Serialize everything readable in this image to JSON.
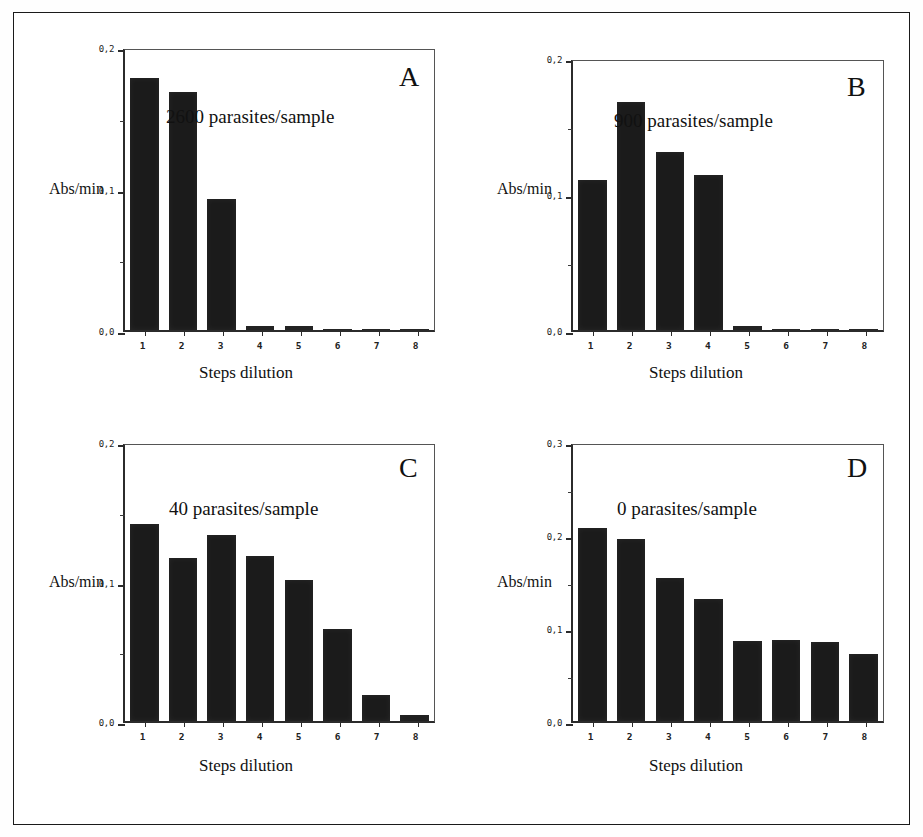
{
  "figure": {
    "axis_title_y": "Abs/min",
    "axis_title_x": "Steps dilution",
    "categories": [
      "1",
      "2",
      "3",
      "4",
      "5",
      "6",
      "7",
      "8"
    ]
  },
  "chart_data": [
    {
      "type": "bar",
      "panel": "A",
      "title": "2600 parasites/sample",
      "categories": [
        "1",
        "2",
        "3",
        "4",
        "5",
        "6",
        "7",
        "8"
      ],
      "values": [
        0.178,
        0.168,
        0.0925,
        0.003,
        0.003,
        0.001,
        0.001,
        0.001
      ],
      "xlabel": "Steps dilution",
      "ylabel": "Abs/min",
      "ylim": [
        0,
        0.2
      ],
      "yticks": [
        "0,0",
        "0,1",
        "0,2"
      ],
      "ytick_values": [
        0.0,
        0.1,
        0.2
      ],
      "yminor_values": [
        0.05,
        0.15
      ],
      "grid": false,
      "legend": "none"
    },
    {
      "type": "bar",
      "panel": "B",
      "title": "900 parasites/sample",
      "categories": [
        "1",
        "2",
        "3",
        "4",
        "5",
        "6",
        "7",
        "8"
      ],
      "values": [
        0.11,
        0.168,
        0.131,
        0.114,
        0.003,
        0.001,
        0.001,
        0.001
      ],
      "xlabel": "Steps dilution",
      "ylabel": "Abs/min",
      "ylim": [
        0,
        0.2
      ],
      "yticks": [
        "0,0",
        "0,1",
        "0,2"
      ],
      "ytick_values": [
        0.0,
        0.1,
        0.2
      ],
      "yminor_values": [
        0.05,
        0.15
      ],
      "grid": false,
      "legend": "none"
    },
    {
      "type": "bar",
      "panel": "C",
      "title": "40 parasites/sample",
      "categories": [
        "1",
        "2",
        "3",
        "4",
        "5",
        "6",
        "7",
        "8"
      ],
      "values": [
        0.141,
        0.117,
        0.133,
        0.118,
        0.101,
        0.066,
        0.0185,
        0.004
      ],
      "xlabel": "Steps dilution",
      "ylabel": "Abs/min",
      "ylim": [
        0,
        0.2
      ],
      "yticks": [
        "0,0",
        "0,1",
        "0,2"
      ],
      "ytick_values": [
        0.0,
        0.1,
        0.2
      ],
      "yminor_values": [
        0.05,
        0.15
      ],
      "grid": false,
      "legend": "none"
    },
    {
      "type": "bar",
      "panel": "D",
      "title": "0 parasites/sample",
      "categories": [
        "1",
        "2",
        "3",
        "4",
        "5",
        "6",
        "7",
        "8"
      ],
      "values": [
        0.208,
        0.196,
        0.154,
        0.131,
        0.086,
        0.087,
        0.085,
        0.072
      ],
      "xlabel": "Steps dilution",
      "ylabel": "Abs/min",
      "ylim": [
        0,
        0.3
      ],
      "yticks": [
        "0,0",
        "0,1",
        "0,2",
        "0,3"
      ],
      "ytick_values": [
        0.0,
        0.1,
        0.2,
        0.3
      ],
      "yminor_values": [
        0.05,
        0.15,
        0.25
      ],
      "grid": false,
      "legend": "none"
    }
  ],
  "colors": {
    "bar": "#1b1b1b",
    "axis": "#2b2b2b",
    "frame": "#1a1a1a",
    "text": "#111111"
  }
}
